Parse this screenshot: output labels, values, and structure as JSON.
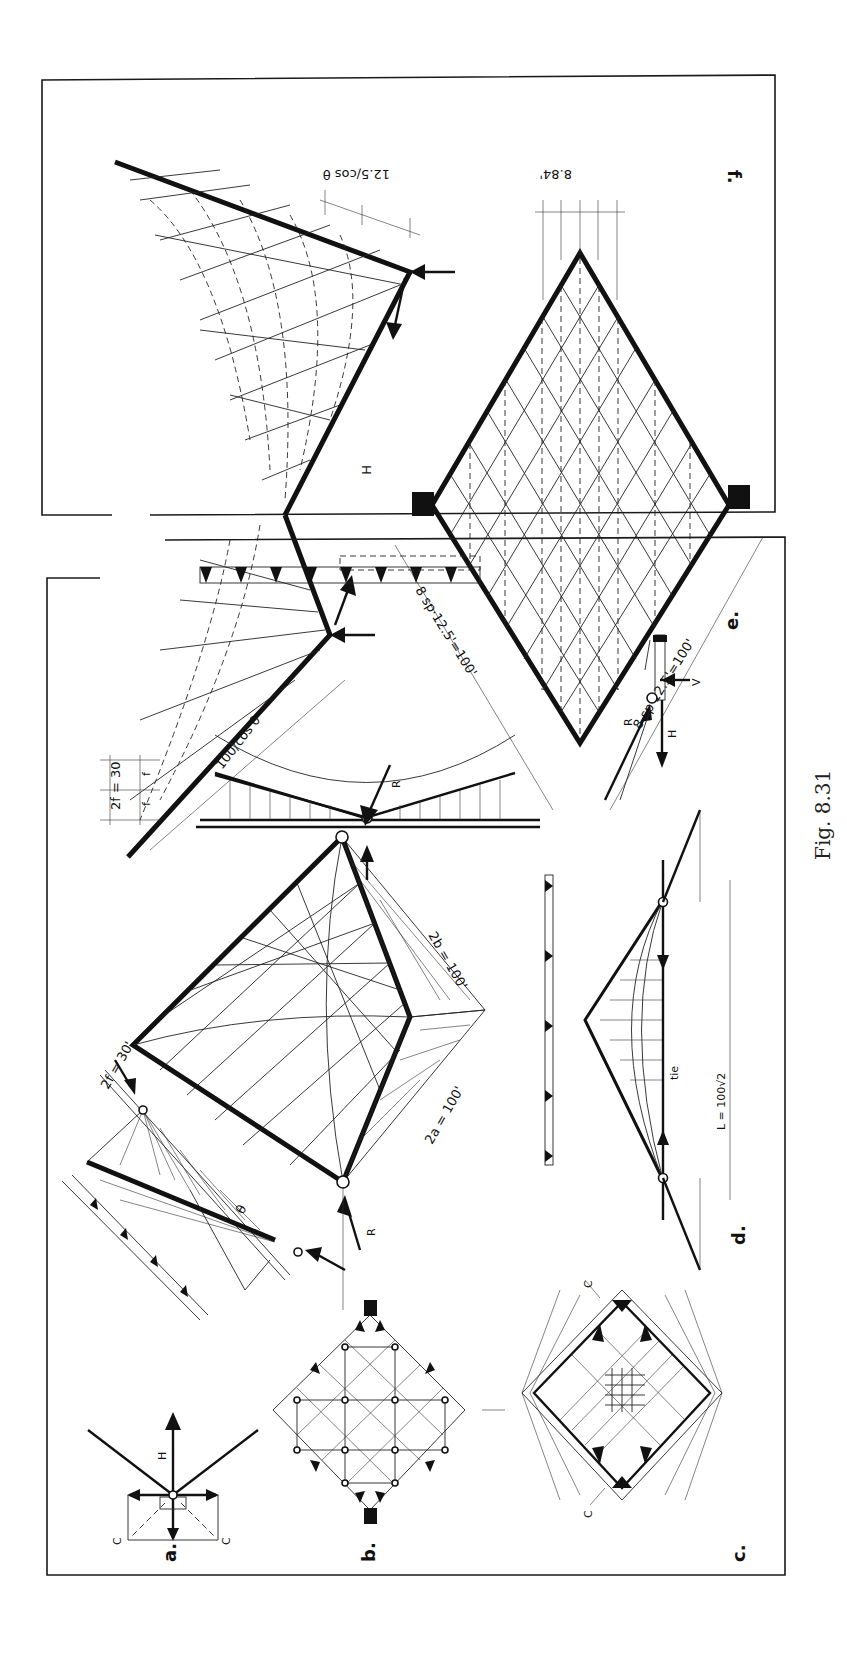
{
  "figure": {
    "caption": "Fig. 8.31",
    "orientation": "rotated 90° clockwise (text reads bottom-to-top)",
    "panels": {
      "a": {
        "label": "a.",
        "labels": [
          "H",
          "Ch",
          "Ch"
        ]
      },
      "b": {
        "label": "b."
      },
      "c": {
        "label": "c.",
        "labels": [
          "C",
          "C"
        ]
      },
      "d": {
        "label": "d.",
        "labels": [
          "tie",
          "L = 100√2"
        ]
      },
      "e": {
        "label": "e.",
        "labels": [
          "V",
          "H",
          "R"
        ]
      },
      "f": {
        "label": "f.",
        "labels": [
          "100/cos θ",
          "12.5/cos θ",
          "H",
          "8.84'",
          "8 sp·12.5'=100'",
          "8 sp·12.5'=100'"
        ]
      },
      "main": {
        "labels": [
          "R",
          "R",
          "2a = 100'",
          "2b = 100'",
          "2f = 30'",
          "θ"
        ]
      },
      "elevation": {
        "labels": [
          "2f = 30",
          "f",
          "f"
        ]
      }
    }
  },
  "text": {
    "caption": "Fig. 8.31",
    "a_label": "a.",
    "b_label": "b.",
    "c_label": "c.",
    "d_label": "d.",
    "e_label": "e.",
    "f_label": "f.",
    "H": "H",
    "Ch": "C",
    "h_sub": "h",
    "C": "C",
    "R": "R",
    "V": "V",
    "tie": "tie",
    "L": "L = 100√2",
    "two_a": "2a = 100'",
    "two_b": "2b = 100'",
    "two_f": "2f = 30'",
    "theta": "θ",
    "elev_2f": "2f = 30",
    "f": "f",
    "len_cos": "100/cos θ",
    "step_cos": "12.5/cos θ",
    "spacing": "8.84'",
    "sp_left": "8 sp·12.5'=100'",
    "sp_right": "8 sp·12.5'=100'"
  },
  "colors": {
    "ink": "#111111",
    "paper": "#ffffff"
  }
}
